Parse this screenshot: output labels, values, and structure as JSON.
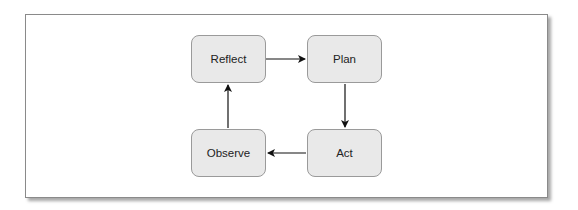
{
  "diagram": {
    "type": "cycle",
    "nodes": [
      {
        "id": "reflect",
        "label": "Reflect"
      },
      {
        "id": "plan",
        "label": "Plan"
      },
      {
        "id": "act",
        "label": "Act"
      },
      {
        "id": "observe",
        "label": "Observe"
      }
    ],
    "edges": [
      {
        "from": "Reflect",
        "to": "Plan"
      },
      {
        "from": "Plan",
        "to": "Act"
      },
      {
        "from": "Act",
        "to": "Observe"
      },
      {
        "from": "Observe",
        "to": "Reflect"
      }
    ],
    "colors": {
      "node_fill": "#e9e9e9",
      "node_border": "#9a9a9a",
      "text": "#222222",
      "arrow": "#111111",
      "frame_border": "#8a8a8a"
    }
  }
}
